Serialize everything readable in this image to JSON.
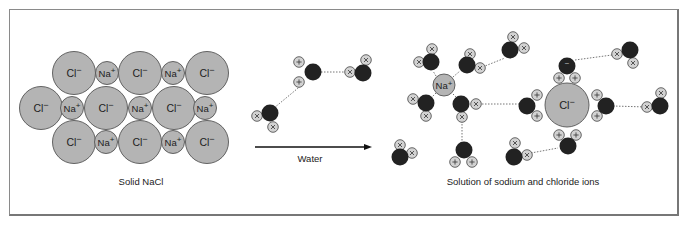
{
  "figure": {
    "solid_caption": "Solid NaCl",
    "solution_caption": "Solution of sodium and chloride ions",
    "arrow_label": "Water",
    "ion_labels": {
      "chloride": "Cl",
      "chloride_charge": "−",
      "sodium": "Na",
      "sodium_charge": "+"
    },
    "colors": {
      "ion_fill": "#b4b4b4",
      "ion_stroke": "#555555",
      "oxygen_fill": "#222222",
      "hydrogen_fill": "#d2d2d2",
      "frame": "#8a8a8a"
    }
  },
  "lattice": {
    "chloride": [
      [
        74,
        73
      ],
      [
        140,
        73
      ],
      [
        207,
        73
      ],
      [
        41,
        108
      ],
      [
        106,
        108
      ],
      [
        174,
        108
      ],
      [
        74,
        142
      ],
      [
        140,
        142
      ],
      [
        207,
        142
      ]
    ],
    "sodium": [
      [
        107,
        73
      ],
      [
        173,
        73
      ],
      [
        72,
        108
      ],
      [
        140,
        108
      ],
      [
        205,
        108
      ],
      [
        106,
        142
      ],
      [
        173,
        142
      ]
    ]
  },
  "solution": {
    "sodium_ion": [
      444,
      85
    ],
    "chloride_ion": [
      567,
      105
    ]
  }
}
